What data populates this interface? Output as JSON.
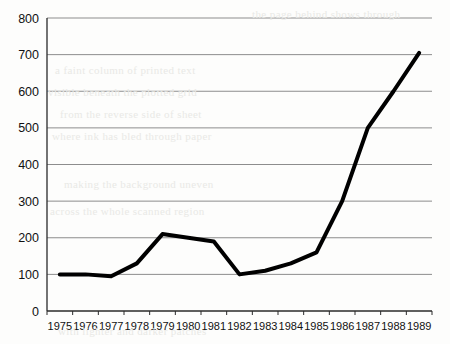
{
  "chart_data": {
    "type": "line",
    "title": "",
    "subtitle": "",
    "xlabel": "",
    "ylabel": "",
    "categories": [
      "1975",
      "1976",
      "1977",
      "1978",
      "1979",
      "1980",
      "1981",
      "1982",
      "1983",
      "1984",
      "1985",
      "1986",
      "1987",
      "1988",
      "1989"
    ],
    "values": [
      100,
      100,
      95,
      130,
      210,
      200,
      190,
      100,
      110,
      130,
      160,
      300,
      500,
      600,
      705
    ],
    "series": [
      {
        "name": "series-1",
        "values": [
          100,
          100,
          95,
          130,
          210,
          200,
          190,
          100,
          110,
          130,
          160,
          300,
          500,
          600,
          705
        ]
      }
    ],
    "ylim": [
      0,
      800
    ],
    "yticks": [
      0,
      100,
      200,
      300,
      400,
      500,
      600,
      700,
      800
    ],
    "ytick_labels": [
      "0",
      "100",
      "200",
      "300",
      "400",
      "500",
      "600",
      "700",
      "800"
    ],
    "xtick_labels": [
      "1975",
      "1976",
      "1977",
      "1978",
      "1979",
      "1980",
      "1981",
      "1982",
      "1983",
      "1984",
      "1985",
      "1986",
      "1987",
      "1988",
      "1989"
    ],
    "grid": true,
    "grid_axis": "y",
    "legend": false,
    "legend_position": "none",
    "line_color": "#000000",
    "line_width": 4,
    "grid_color": "#8d8d8d",
    "axis_color": "#2a2a2a",
    "background_color": "#fdfdfc",
    "annotations": []
  },
  "page_artifacts": {
    "note": "faint scanned-page bleed-through text behind the plot",
    "ghost_lines": [
      "the page behind shows through",
      "a faint column of printed text",
      "visible beneath the plotted grid",
      "from the reverse side of sheet",
      "where ink has bled through paper",
      "making the background uneven",
      "across the whole scanned region",
      "with lighter and darker patches"
    ]
  }
}
